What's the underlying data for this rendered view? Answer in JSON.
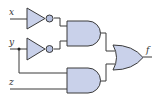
{
  "diagram": {
    "title": "",
    "type": "logic-circuit",
    "colors": {
      "gate_fill": "#c9d1ea",
      "gate_stroke": "#3a3a3a",
      "wire": "#3a3a3a",
      "bubble_fill": "#b6c0de",
      "background": "#ffffff"
    },
    "inputs": [
      {
        "id": "x",
        "label": "x"
      },
      {
        "id": "y",
        "label": "y"
      },
      {
        "id": "z",
        "label": "z"
      }
    ],
    "outputs": [
      {
        "id": "f",
        "label": "f"
      }
    ],
    "gates": [
      {
        "id": "not1",
        "type": "NOT",
        "inputs": [
          "x"
        ]
      },
      {
        "id": "not2",
        "type": "NOT",
        "inputs": [
          "y"
        ]
      },
      {
        "id": "and1",
        "type": "AND",
        "inputs": [
          "not1",
          "not2"
        ]
      },
      {
        "id": "and2",
        "type": "AND",
        "inputs": [
          "y",
          "z"
        ]
      },
      {
        "id": "or1",
        "type": "OR",
        "inputs": [
          "and1",
          "and2"
        ],
        "output": "f"
      }
    ],
    "expression": "f = x'y' + yz"
  }
}
